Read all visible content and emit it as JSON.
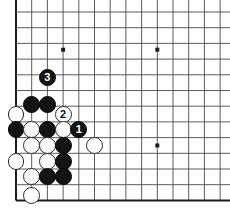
{
  "figure": {
    "name": "go-board-corner-diagram",
    "type": "go-diagram",
    "background_color": "#ffffff",
    "line_color": "#4a4a4a",
    "edge_color": "#1c1c1c",
    "black_stone_color": "#141414",
    "white_stone_color": "#ffffff",
    "white_stone_border_color": "#2a2a2a"
  },
  "board": {
    "origin_x": 16,
    "origin_y": 12,
    "spacing": 15.7,
    "columns": 14,
    "rows": 12,
    "left_edge_is_board_edge": true,
    "bottom_edge_is_board_edge": true,
    "top_edge_is_board_edge": false,
    "right_edge_is_board_edge": false,
    "star_points": [
      {
        "col": 3,
        "row": 2.4
      },
      {
        "col": 9,
        "row": 2.4
      },
      {
        "col": 9,
        "row": 8.5
      }
    ]
  },
  "stones": [
    {
      "id": "w-a",
      "color": "white",
      "col": 0,
      "row": 6.5,
      "label": ""
    },
    {
      "id": "b-a",
      "color": "black",
      "col": 1,
      "row": 5.9,
      "label": ""
    },
    {
      "id": "b-b",
      "color": "black",
      "col": 2,
      "row": 5.9,
      "label": ""
    },
    {
      "id": "w-b",
      "color": "white",
      "col": 3,
      "row": 6.5,
      "label": "2"
    },
    {
      "id": "b-c",
      "color": "black",
      "col": 0,
      "row": 7.5,
      "label": ""
    },
    {
      "id": "w-c",
      "color": "white",
      "col": 1,
      "row": 7.5,
      "label": ""
    },
    {
      "id": "b-d",
      "color": "black",
      "col": 2,
      "row": 7.5,
      "label": ""
    },
    {
      "id": "w-d",
      "color": "white",
      "col": 3,
      "row": 7.5,
      "label": ""
    },
    {
      "id": "b-e",
      "color": "black",
      "col": 4,
      "row": 7.5,
      "label": "1"
    },
    {
      "id": "w-e",
      "color": "white",
      "col": 1,
      "row": 8.5,
      "label": ""
    },
    {
      "id": "w-f",
      "color": "white",
      "col": 2,
      "row": 8.5,
      "label": ""
    },
    {
      "id": "b-f",
      "color": "black",
      "col": 3,
      "row": 8.5,
      "label": ""
    },
    {
      "id": "w-g",
      "color": "white",
      "col": 5,
      "row": 8.5,
      "label": ""
    },
    {
      "id": "w-h",
      "color": "white",
      "col": 0,
      "row": 9.5,
      "label": ""
    },
    {
      "id": "w-i",
      "color": "white",
      "col": 2,
      "row": 9.5,
      "label": ""
    },
    {
      "id": "b-g",
      "color": "black",
      "col": 3,
      "row": 9.5,
      "label": ""
    },
    {
      "id": "w-j",
      "color": "white",
      "col": 1,
      "row": 10.5,
      "label": ""
    },
    {
      "id": "b-h",
      "color": "black",
      "col": 2,
      "row": 10.5,
      "label": ""
    },
    {
      "id": "b-i",
      "color": "black",
      "col": 3,
      "row": 10.5,
      "label": ""
    },
    {
      "id": "w-k",
      "color": "white",
      "col": 1,
      "row": 11.7,
      "label": ""
    },
    {
      "id": "b-j",
      "color": "black",
      "col": 2,
      "row": 4.2,
      "label": "3"
    }
  ],
  "move_labels": {
    "move_1": "1",
    "move_2": "2",
    "move_3": "3"
  }
}
